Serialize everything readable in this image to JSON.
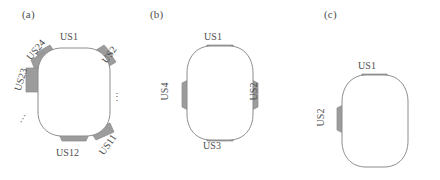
{
  "figure": {
    "type": "diagram",
    "background_color": "#ffffff",
    "body_outline_color": "#8c8c8c",
    "body_fill_color": "#ffffff",
    "sensor_fill_color": "#9c9c9c",
    "sensor_outline_color": "#8a8a8a",
    "label_text_color": "#4d4d4d"
  },
  "panels": [
    {
      "id": "a",
      "caption": "(a)",
      "sensor_count": 24,
      "labels": [
        {
          "id": "us1",
          "text": "US1",
          "rotation": 0,
          "left": 60,
          "top": 31
        },
        {
          "id": "us2",
          "text": "US2",
          "rotation": -55,
          "left": 100,
          "top": 49
        },
        {
          "id": "us23",
          "text": "US23",
          "rotation": -73,
          "left": 9,
          "top": 74
        },
        {
          "id": "us24",
          "text": "US24",
          "rotation": -50,
          "left": 24,
          "top": 44
        },
        {
          "id": "us11",
          "text": "US11",
          "rotation": -55,
          "left": 96,
          "top": 139
        },
        {
          "id": "us12",
          "text": "US12",
          "rotation": 0,
          "left": 56,
          "top": 147
        }
      ],
      "ellipses": [
        {
          "id": "dots-right",
          "text": "⋮",
          "rotation": 0,
          "left": 112,
          "top": 91
        },
        {
          "id": "dots-left",
          "text": "⋮",
          "rotation": 30,
          "left": 18,
          "top": 113
        }
      ]
    },
    {
      "id": "b",
      "caption": "(b)",
      "sensor_count": 4,
      "labels": [
        {
          "id": "us1",
          "text": "US1",
          "rotation": 0,
          "left": 59,
          "top": 31
        },
        {
          "id": "us2",
          "text": "US2",
          "rotation": -90,
          "left": 99,
          "top": 86
        },
        {
          "id": "us3",
          "text": "US3",
          "rotation": 0,
          "left": 58,
          "top": 140
        },
        {
          "id": "us4",
          "text": "US4",
          "rotation": -90,
          "left": 10,
          "top": 86
        }
      ],
      "ellipses": []
    },
    {
      "id": "c",
      "caption": "(c)",
      "sensor_count": 2,
      "labels": [
        {
          "id": "us1",
          "text": "US1",
          "rotation": 0,
          "left": 66,
          "top": 60
        },
        {
          "id": "us2",
          "text": "US2",
          "rotation": -90,
          "left": 19,
          "top": 112
        }
      ],
      "ellipses": []
    }
  ]
}
